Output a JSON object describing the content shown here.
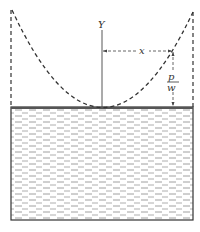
{
  "diagram": {
    "labels": {
      "y_axis": "Y",
      "x_dim": "x",
      "p_numer": "p",
      "p_denom": "w"
    },
    "colors": {
      "line": "#333333",
      "water_dash": "#777777",
      "background": "#ffffff"
    },
    "geometry": {
      "container": {
        "left": 11,
        "right": 193,
        "top": 8,
        "bottom": 220
      },
      "water_surface_y": 107,
      "axis_x": 102,
      "vertex": {
        "x": 102,
        "y": 107
      },
      "point": {
        "x": 173,
        "y": 51
      }
    }
  }
}
